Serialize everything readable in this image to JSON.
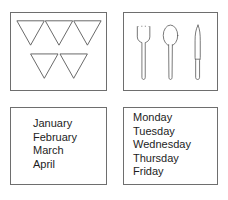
{
  "page": {
    "background_color": "#ffffff",
    "border_color": "#6e6e6e",
    "text_color": "#1d1d1d",
    "layout": "2x2 grid of bordered panels"
  },
  "panels": {
    "shapes": {
      "name": "triangles-panel",
      "figure_type": "downward-pointing-triangles",
      "count": 5,
      "rows": [
        {
          "count": 3,
          "triangles": [
            "triangle-1",
            "triangle-2",
            "triangle-3"
          ]
        },
        {
          "count": 2,
          "triangles": [
            "triangle-4",
            "triangle-5"
          ]
        }
      ],
      "stroke_color": "#555555",
      "fill_color": "#ffffff"
    },
    "cutlery": {
      "name": "cutlery-panel",
      "items": [
        {
          "icon": "fork-icon",
          "label": "fork",
          "tines": 4
        },
        {
          "icon": "spoon-icon",
          "label": "spoon"
        },
        {
          "icon": "knife-icon",
          "label": "knife"
        }
      ],
      "stroke_color": "#555555",
      "fill_color": "#ffffff"
    },
    "months": {
      "name": "months-panel",
      "items": [
        "January",
        "February",
        "March",
        "April"
      ]
    },
    "days": {
      "name": "days-panel",
      "items": [
        "Monday",
        "Tuesday",
        "Wednesday",
        "Thursday",
        "Friday"
      ]
    }
  }
}
